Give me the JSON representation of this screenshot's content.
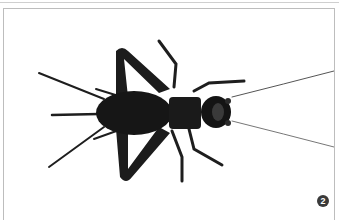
{
  "figure": {
    "badge_number": "2"
  },
  "colors": {
    "background": "#ffffff",
    "border": "#bdbdbd",
    "insect": "#1a1a1a",
    "badge": "#3a3a3a"
  }
}
